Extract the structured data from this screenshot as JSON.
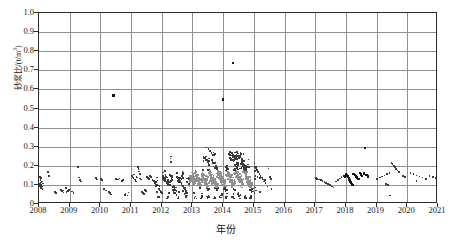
{
  "chart_data": {
    "type": "scatter",
    "title": "",
    "xlabel": "年份",
    "ylabel": "砂浆比/(t/m³)",
    "ylabel_main": "砂浆比/(t/m",
    "ylabel_sup": "3",
    "ylabel_tail": ")",
    "xlim": [
      2008,
      2021
    ],
    "ylim": [
      0,
      1.0
    ],
    "grid": true,
    "legend": null,
    "xticks": [
      2008,
      2009,
      2010,
      2011,
      2012,
      2013,
      2014,
      2015,
      2016,
      2017,
      2018,
      2019,
      2020,
      2021
    ],
    "xtick_labels": [
      "2008",
      "2009",
      "2010",
      "2011",
      "2012",
      "2013",
      "2014",
      "2015",
      "2016",
      "2017",
      "2018",
      "2019",
      "2020",
      "2021"
    ],
    "yticks": [
      0,
      0.1,
      0.2,
      0.3,
      0.4,
      0.5,
      0.6,
      0.7,
      0.8,
      0.9,
      1.0
    ],
    "ytick_labels": [
      "0",
      "0.1",
      "0.2",
      "0.3",
      "0.4",
      "0.5",
      "0.6",
      "0.7",
      "0.8",
      "0.9",
      "1.0"
    ],
    "marker": "square",
    "marker_colors": [
      "#3a3a3a",
      "#8f8f8f",
      "#151515"
    ],
    "notable_outliers": [
      {
        "x": 2010.42,
        "y": 0.57
      },
      {
        "x": 2014.32,
        "y": 0.74
      },
      {
        "x": 2013.98,
        "y": 0.55
      },
      {
        "x": 2018.62,
        "y": 0.295
      }
    ],
    "data_gap": [
      2015.6,
      2017.0
    ],
    "points": [
      [
        2008.03,
        0.095
      ],
      [
        2008.04,
        0.105
      ],
      [
        2008.05,
        0.088
      ],
      [
        2008.06,
        0.112
      ],
      [
        2008.05,
        0.125
      ],
      [
        2008.07,
        0.082
      ],
      [
        2008.06,
        0.135
      ],
      [
        2008.08,
        0.099
      ],
      [
        2008.04,
        0.143
      ],
      [
        2008.09,
        0.091
      ],
      [
        2008.1,
        0.118
      ],
      [
        2008.11,
        0.078
      ],
      [
        2008.12,
        0.107
      ],
      [
        2008.3,
        0.167
      ],
      [
        2008.33,
        0.148
      ],
      [
        2008.52,
        0.062
      ],
      [
        2008.55,
        0.058
      ],
      [
        2008.72,
        0.073
      ],
      [
        2008.75,
        0.066
      ],
      [
        2008.78,
        0.07
      ],
      [
        2008.8,
        0.061
      ],
      [
        2008.88,
        0.082
      ],
      [
        2008.9,
        0.064
      ],
      [
        2008.95,
        0.069
      ],
      [
        2008.98,
        0.075
      ],
      [
        2009.08,
        0.065
      ],
      [
        2009.12,
        0.059
      ],
      [
        2009.28,
        0.194
      ],
      [
        2009.3,
        0.139
      ],
      [
        2009.33,
        0.127
      ],
      [
        2009.36,
        0.118
      ],
      [
        2009.85,
        0.135
      ],
      [
        2009.9,
        0.129
      ],
      [
        2010.02,
        0.131
      ],
      [
        2010.06,
        0.126
      ],
      [
        2010.12,
        0.078
      ],
      [
        2010.18,
        0.071
      ],
      [
        2010.28,
        0.062
      ],
      [
        2010.32,
        0.056
      ],
      [
        2010.35,
        0.049
      ],
      [
        2010.42,
        0.57
      ],
      [
        2010.52,
        0.131
      ],
      [
        2010.58,
        0.128
      ],
      [
        2010.62,
        0.134
      ],
      [
        2010.7,
        0.122
      ],
      [
        2010.74,
        0.127
      ],
      [
        2010.8,
        0.047
      ],
      [
        2010.82,
        0.052
      ],
      [
        2010.88,
        0.044
      ],
      [
        2010.92,
        0.06
      ],
      [
        2011.02,
        0.148
      ],
      [
        2011.05,
        0.142
      ],
      [
        2011.08,
        0.136
      ],
      [
        2011.1,
        0.155
      ],
      [
        2011.12,
        0.129
      ],
      [
        2011.14,
        0.124
      ],
      [
        2011.16,
        0.118
      ],
      [
        2011.18,
        0.144
      ],
      [
        2011.2,
        0.138
      ],
      [
        2011.22,
        0.192
      ],
      [
        2011.24,
        0.182
      ],
      [
        2011.26,
        0.17
      ],
      [
        2011.28,
        0.158
      ],
      [
        2011.3,
        0.133
      ],
      [
        2011.33,
        0.128
      ],
      [
        2011.36,
        0.064
      ],
      [
        2011.38,
        0.058
      ],
      [
        2011.42,
        0.051
      ],
      [
        2011.45,
        0.073
      ],
      [
        2011.48,
        0.069
      ],
      [
        2011.52,
        0.14
      ],
      [
        2011.55,
        0.136
      ],
      [
        2011.58,
        0.131
      ],
      [
        2011.62,
        0.147
      ],
      [
        2011.66,
        0.142
      ],
      [
        2011.7,
        0.127
      ],
      [
        2011.74,
        0.119
      ],
      [
        2011.78,
        0.109
      ],
      [
        2011.82,
        0.114
      ],
      [
        2011.86,
        0.123
      ],
      [
        2011.9,
        0.079
      ],
      [
        2011.94,
        0.071
      ],
      [
        2011.98,
        0.064
      ],
      [
        2012.02,
        0.147
      ],
      [
        2012.05,
        0.14
      ],
      [
        2012.08,
        0.135
      ],
      [
        2012.1,
        0.129
      ],
      [
        2012.12,
        0.152
      ],
      [
        2012.15,
        0.143
      ],
      [
        2012.18,
        0.138
      ],
      [
        2012.2,
        0.124
      ],
      [
        2012.22,
        0.118
      ],
      [
        2012.25,
        0.112
      ],
      [
        2012.28,
        0.238
      ],
      [
        2012.3,
        0.148
      ],
      [
        2012.32,
        0.133
      ],
      [
        2012.35,
        0.127
      ],
      [
        2012.38,
        0.097
      ],
      [
        2012.4,
        0.089
      ],
      [
        2012.42,
        0.082
      ],
      [
        2012.45,
        0.074
      ],
      [
        2012.48,
        0.068
      ],
      [
        2012.5,
        0.141
      ],
      [
        2012.53,
        0.136
      ],
      [
        2012.56,
        0.13
      ],
      [
        2012.58,
        0.125
      ],
      [
        2012.6,
        0.119
      ],
      [
        2012.63,
        0.113
      ],
      [
        2012.66,
        0.148
      ],
      [
        2012.68,
        0.142
      ],
      [
        2012.7,
        0.093
      ],
      [
        2012.72,
        0.085
      ],
      [
        2012.75,
        0.078
      ],
      [
        2012.78,
        0.071
      ],
      [
        2012.8,
        0.064
      ],
      [
        2012.82,
        0.058
      ],
      [
        2012.85,
        0.134
      ],
      [
        2012.88,
        0.128
      ],
      [
        2012.9,
        0.122
      ],
      [
        2012.92,
        0.116
      ],
      [
        2012.95,
        0.146
      ],
      [
        2012.98,
        0.139
      ],
      [
        2013.0,
        0.133
      ],
      [
        2013.02,
        0.127
      ],
      [
        2013.04,
        0.121
      ],
      [
        2013.06,
        0.115
      ],
      [
        2013.08,
        0.109
      ],
      [
        2013.1,
        0.152
      ],
      [
        2013.12,
        0.146
      ],
      [
        2013.14,
        0.14
      ],
      [
        2013.16,
        0.134
      ],
      [
        2013.18,
        0.128
      ],
      [
        2013.2,
        0.122
      ],
      [
        2013.22,
        0.116
      ],
      [
        2013.24,
        0.11
      ],
      [
        2013.26,
        0.104
      ],
      [
        2013.28,
        0.098
      ],
      [
        2013.3,
        0.158
      ],
      [
        2013.32,
        0.151
      ],
      [
        2013.34,
        0.145
      ],
      [
        2013.36,
        0.139
      ],
      [
        2013.38,
        0.133
      ],
      [
        2013.4,
        0.127
      ],
      [
        2013.42,
        0.121
      ],
      [
        2013.44,
        0.115
      ],
      [
        2013.46,
        0.109
      ],
      [
        2013.48,
        0.103
      ],
      [
        2013.5,
        0.097
      ],
      [
        2013.52,
        0.091
      ],
      [
        2013.54,
        0.162
      ],
      [
        2013.56,
        0.156
      ],
      [
        2013.58,
        0.15
      ],
      [
        2013.6,
        0.144
      ],
      [
        2013.62,
        0.138
      ],
      [
        2013.64,
        0.132
      ],
      [
        2013.66,
        0.126
      ],
      [
        2013.68,
        0.12
      ],
      [
        2013.7,
        0.114
      ],
      [
        2013.72,
        0.108
      ],
      [
        2013.74,
        0.102
      ],
      [
        2013.76,
        0.096
      ],
      [
        2013.78,
        0.09
      ],
      [
        2013.8,
        0.084
      ],
      [
        2013.82,
        0.168
      ],
      [
        2013.84,
        0.16
      ],
      [
        2013.86,
        0.154
      ],
      [
        2013.88,
        0.148
      ],
      [
        2013.9,
        0.142
      ],
      [
        2013.92,
        0.136
      ],
      [
        2013.94,
        0.13
      ],
      [
        2013.96,
        0.124
      ],
      [
        2013.98,
        0.118
      ],
      [
        2014.0,
        0.112
      ],
      [
        2014.02,
        0.106
      ],
      [
        2014.04,
        0.1
      ],
      [
        2014.06,
        0.094
      ],
      [
        2014.08,
        0.088
      ],
      [
        2014.1,
        0.176
      ],
      [
        2014.12,
        0.17
      ],
      [
        2014.14,
        0.164
      ],
      [
        2014.16,
        0.158
      ],
      [
        2014.18,
        0.152
      ],
      [
        2014.2,
        0.146
      ],
      [
        2014.22,
        0.14
      ],
      [
        2014.24,
        0.134
      ],
      [
        2014.26,
        0.128
      ],
      [
        2014.28,
        0.122
      ],
      [
        2014.3,
        0.116
      ],
      [
        2014.32,
        0.11
      ],
      [
        2014.34,
        0.104
      ],
      [
        2014.36,
        0.098
      ],
      [
        2014.38,
        0.184
      ],
      [
        2014.4,
        0.178
      ],
      [
        2014.42,
        0.172
      ],
      [
        2014.44,
        0.166
      ],
      [
        2014.46,
        0.16
      ],
      [
        2014.48,
        0.154
      ],
      [
        2014.5,
        0.148
      ],
      [
        2014.52,
        0.142
      ],
      [
        2014.54,
        0.136
      ],
      [
        2014.56,
        0.13
      ],
      [
        2014.58,
        0.124
      ],
      [
        2014.6,
        0.118
      ],
      [
        2014.62,
        0.112
      ],
      [
        2014.64,
        0.106
      ],
      [
        2014.66,
        0.19
      ],
      [
        2014.68,
        0.182
      ],
      [
        2014.7,
        0.174
      ],
      [
        2014.72,
        0.166
      ],
      [
        2014.74,
        0.158
      ],
      [
        2014.76,
        0.15
      ],
      [
        2014.78,
        0.142
      ],
      [
        2014.8,
        0.134
      ],
      [
        2014.82,
        0.126
      ],
      [
        2014.84,
        0.118
      ],
      [
        2014.86,
        0.11
      ],
      [
        2014.88,
        0.102
      ],
      [
        2014.9,
        0.094
      ],
      [
        2014.92,
        0.086
      ],
      [
        2014.94,
        0.078
      ],
      [
        2013.45,
        0.295
      ],
      [
        2013.52,
        0.288
      ],
      [
        2013.58,
        0.276
      ],
      [
        2013.62,
        0.268
      ],
      [
        2013.7,
        0.258
      ],
      [
        2013.4,
        0.24
      ],
      [
        2013.48,
        0.232
      ],
      [
        2013.55,
        0.225
      ],
      [
        2013.66,
        0.218
      ],
      [
        2013.74,
        0.212
      ],
      [
        2014.18,
        0.262
      ],
      [
        2014.24,
        0.255
      ],
      [
        2014.3,
        0.248
      ],
      [
        2014.38,
        0.242
      ],
      [
        2014.44,
        0.258
      ],
      [
        2014.5,
        0.25
      ],
      [
        2014.56,
        0.244
      ],
      [
        2014.62,
        0.236
      ],
      [
        2014.26,
        0.228
      ],
      [
        2014.34,
        0.222
      ],
      [
        2014.46,
        0.216
      ],
      [
        2014.58,
        0.21
      ],
      [
        2014.66,
        0.204
      ],
      [
        2014.72,
        0.198
      ],
      [
        2014.8,
        0.206
      ],
      [
        2014.32,
        0.74
      ],
      [
        2013.98,
        0.548
      ],
      [
        2013.1,
        0.04
      ],
      [
        2013.3,
        0.036
      ],
      [
        2013.52,
        0.042
      ],
      [
        2013.72,
        0.038
      ],
      [
        2013.92,
        0.034
      ],
      [
        2014.12,
        0.04
      ],
      [
        2014.32,
        0.036
      ],
      [
        2014.52,
        0.042
      ],
      [
        2014.72,
        0.038
      ],
      [
        2014.88,
        0.034
      ],
      [
        2012.55,
        0.038
      ],
      [
        2012.78,
        0.034
      ],
      [
        2011.9,
        0.04
      ],
      [
        2012.2,
        0.036
      ],
      [
        2015.02,
        0.196
      ],
      [
        2015.06,
        0.188
      ],
      [
        2015.1,
        0.178
      ],
      [
        2015.14,
        0.168
      ],
      [
        2015.18,
        0.158
      ],
      [
        2015.22,
        0.148
      ],
      [
        2015.26,
        0.138
      ],
      [
        2015.3,
        0.128
      ],
      [
        2015.34,
        0.118
      ],
      [
        2015.38,
        0.11
      ],
      [
        2015.05,
        0.148
      ],
      [
        2015.12,
        0.142
      ],
      [
        2015.2,
        0.136
      ],
      [
        2015.28,
        0.13
      ],
      [
        2015.36,
        0.124
      ],
      [
        2015.44,
        0.196
      ],
      [
        2015.48,
        0.186
      ],
      [
        2015.52,
        0.14
      ],
      [
        2015.56,
        0.132
      ],
      [
        2015.44,
        0.092
      ],
      [
        2015.58,
        0.078
      ],
      [
        2015.06,
        0.07
      ],
      [
        2015.2,
        0.064
      ],
      [
        2017.02,
        0.137
      ],
      [
        2017.06,
        0.132
      ],
      [
        2017.12,
        0.128
      ],
      [
        2017.18,
        0.124
      ],
      [
        2017.24,
        0.12
      ],
      [
        2017.3,
        0.116
      ],
      [
        2017.36,
        0.11
      ],
      [
        2017.42,
        0.104
      ],
      [
        2017.48,
        0.098
      ],
      [
        2017.54,
        0.092
      ],
      [
        2017.6,
        0.087
      ],
      [
        2017.68,
        0.118
      ],
      [
        2017.74,
        0.126
      ],
      [
        2017.8,
        0.134
      ],
      [
        2017.86,
        0.142
      ],
      [
        2017.92,
        0.15
      ],
      [
        2017.96,
        0.146
      ],
      [
        2018.0,
        0.16
      ],
      [
        2018.02,
        0.154
      ],
      [
        2018.04,
        0.148
      ],
      [
        2018.06,
        0.142
      ],
      [
        2018.08,
        0.136
      ],
      [
        2018.1,
        0.13
      ],
      [
        2018.12,
        0.124
      ],
      [
        2018.14,
        0.118
      ],
      [
        2018.16,
        0.112
      ],
      [
        2018.18,
        0.106
      ],
      [
        2018.2,
        0.1
      ],
      [
        2018.24,
        0.158
      ],
      [
        2018.28,
        0.152
      ],
      [
        2018.32,
        0.146
      ],
      [
        2018.36,
        0.14
      ],
      [
        2018.4,
        0.134
      ],
      [
        2018.44,
        0.164
      ],
      [
        2018.48,
        0.156
      ],
      [
        2018.52,
        0.148
      ],
      [
        2018.58,
        0.162
      ],
      [
        2018.62,
        0.295
      ],
      [
        2018.66,
        0.154
      ],
      [
        2018.72,
        0.146
      ],
      [
        2019.02,
        0.132
      ],
      [
        2019.1,
        0.138
      ],
      [
        2019.18,
        0.144
      ],
      [
        2019.26,
        0.15
      ],
      [
        2019.34,
        0.156
      ],
      [
        2019.42,
        0.162
      ],
      [
        2019.48,
        0.216
      ],
      [
        2019.52,
        0.208
      ],
      [
        2019.56,
        0.2
      ],
      [
        2019.6,
        0.192
      ],
      [
        2019.64,
        0.184
      ],
      [
        2019.68,
        0.176
      ],
      [
        2019.72,
        0.168
      ],
      [
        2019.3,
        0.106
      ],
      [
        2019.38,
        0.098
      ],
      [
        2019.44,
        0.044
      ],
      [
        2019.86,
        0.148
      ],
      [
        2019.92,
        0.142
      ],
      [
        2020.1,
        0.162
      ],
      [
        2020.2,
        0.156
      ],
      [
        2020.3,
        0.15
      ],
      [
        2020.4,
        0.144
      ],
      [
        2020.5,
        0.138
      ],
      [
        2020.6,
        0.132
      ],
      [
        2020.72,
        0.148
      ],
      [
        2020.84,
        0.14
      ],
      [
        2020.92,
        0.136
      ],
      [
        2020.3,
        0.122
      ]
    ]
  }
}
